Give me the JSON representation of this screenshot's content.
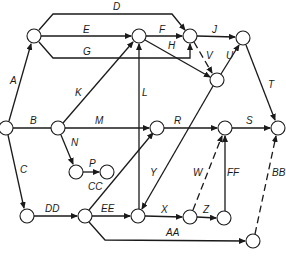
{
  "colors": {
    "line": "#1a1a1a",
    "node_fill": "#ffffff",
    "background": "#ffffff"
  },
  "nodes": [
    {
      "id": "n1",
      "x": 6,
      "y": 128
    },
    {
      "id": "n2",
      "x": 34,
      "y": 36
    },
    {
      "id": "n3",
      "x": 58,
      "y": 128
    },
    {
      "id": "n4",
      "x": 139,
      "y": 36
    },
    {
      "id": "n5",
      "x": 190,
      "y": 36
    },
    {
      "id": "n6",
      "x": 243,
      "y": 38
    },
    {
      "id": "n7",
      "x": 217,
      "y": 80
    },
    {
      "id": "n8",
      "x": 157,
      "y": 128
    },
    {
      "id": "n9",
      "x": 225,
      "y": 128
    },
    {
      "id": "n10",
      "x": 278,
      "y": 128
    },
    {
      "id": "n11",
      "x": 76,
      "y": 172
    },
    {
      "id": "n12",
      "x": 107,
      "y": 172
    },
    {
      "id": "n13",
      "x": 27,
      "y": 216
    },
    {
      "id": "n14",
      "x": 85,
      "y": 216
    },
    {
      "id": "n15",
      "x": 138,
      "y": 216
    },
    {
      "id": "n16",
      "x": 190,
      "y": 217
    },
    {
      "id": "n17",
      "x": 224,
      "y": 218
    },
    {
      "id": "n18",
      "x": 253,
      "y": 241
    }
  ],
  "edges": [
    {
      "label": "A",
      "from": "n1",
      "to": "n2",
      "dashed": false,
      "lx": 10,
      "ly": 84
    },
    {
      "label": "B",
      "from": "n1",
      "to": "n3",
      "dashed": false,
      "lx": 30,
      "ly": 124
    },
    {
      "label": "C",
      "from": "n1",
      "to": "n13",
      "dashed": false,
      "lx": 20,
      "ly": 173
    },
    {
      "label": "D",
      "from": "n2",
      "to": "n5",
      "dashed": false,
      "lx": 113,
      "ly": 10
    },
    {
      "label": "E",
      "from": "n2",
      "to": "n4",
      "dashed": false,
      "lx": 83,
      "ly": 33
    },
    {
      "label": "G",
      "from": "n2",
      "to": "n5",
      "dashed": false,
      "lx": 83,
      "ly": 55
    },
    {
      "label": "F",
      "from": "n4",
      "to": "n5",
      "dashed": false,
      "lx": 159,
      "ly": 33
    },
    {
      "label": "H",
      "from": "n4",
      "to": "n7",
      "dashed": false,
      "lx": 168,
      "ly": 49
    },
    {
      "label": "J",
      "from": "n5",
      "to": "n6",
      "dashed": false,
      "lx": 212,
      "ly": 33
    },
    {
      "label": "V",
      "from": "n5",
      "to": "n7",
      "dashed": true,
      "lx": 206,
      "ly": 59
    },
    {
      "label": "U",
      "from": "n7",
      "to": "n6",
      "dashed": false,
      "lx": 226,
      "ly": 59
    },
    {
      "label": "T",
      "from": "n6",
      "to": "n10",
      "dashed": false,
      "lx": 268,
      "ly": 88
    },
    {
      "label": "K",
      "from": "n3",
      "to": "n4",
      "dashed": false,
      "lx": 75,
      "ly": 96
    },
    {
      "label": "M",
      "from": "n3",
      "to": "n8",
      "dashed": false,
      "lx": 95,
      "ly": 124
    },
    {
      "label": "L",
      "from": "n15",
      "to": "n4",
      "dashed": false,
      "lx": 142,
      "ly": 96
    },
    {
      "label": "R",
      "from": "n8",
      "to": "n9",
      "dashed": false,
      "lx": 174,
      "ly": 124
    },
    {
      "label": "S",
      "from": "n9",
      "to": "n10",
      "dashed": false,
      "lx": 246,
      "ly": 124
    },
    {
      "label": "N",
      "from": "n3",
      "to": "n11",
      "dashed": false,
      "lx": 71,
      "ly": 146
    },
    {
      "label": "P",
      "from": "n11",
      "to": "n12",
      "dashed": false,
      "lx": 89,
      "ly": 167
    },
    {
      "label": "CC",
      "from": null,
      "to": null,
      "dashed": false,
      "lx": 88,
      "ly": 190
    },
    {
      "label": "Y",
      "from": "n7",
      "to": "n15",
      "dashed": false,
      "lx": 150,
      "ly": 176
    },
    {
      "label": "W",
      "from": "n16",
      "to": "n9",
      "dashed": true,
      "lx": 193,
      "ly": 176
    },
    {
      "label": "FF",
      "from": "n17",
      "to": "n9",
      "dashed": false,
      "lx": 227,
      "ly": 176
    },
    {
      "label": "BB",
      "from": "n18",
      "to": "n10",
      "dashed": true,
      "lx": 272,
      "ly": 176
    },
    {
      "label": "DD",
      "from": "n13",
      "to": "n14",
      "dashed": false,
      "lx": 45,
      "ly": 212
    },
    {
      "label": "EE",
      "from": "n14",
      "to": "n15",
      "dashed": false,
      "lx": 101,
      "ly": 212
    },
    {
      "label": "X",
      "from": "n15",
      "to": "n16",
      "dashed": false,
      "lx": 161,
      "ly": 213
    },
    {
      "label": "Z",
      "from": "n16",
      "to": "n17",
      "dashed": false,
      "lx": 203,
      "ly": 213
    },
    {
      "label": "AA",
      "from": "n14",
      "to": "n18",
      "dashed": false,
      "lx": 166,
      "ly": 236
    }
  ]
}
